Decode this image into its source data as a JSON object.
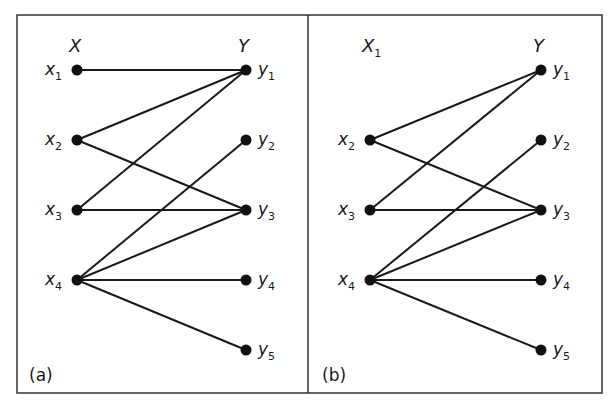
{
  "figure": {
    "frame": {
      "x": 17,
      "y": 15,
      "width": 585,
      "height": 378,
      "divider_x": 308
    },
    "colors": {
      "stroke": "#1a1a1a",
      "node": "#111111",
      "background": "#ffffff"
    },
    "panels": [
      {
        "id": "a",
        "caption": "(a)",
        "set_labels": {
          "x": "X",
          "x_sub": "",
          "y": "Y"
        },
        "x_col": 77,
        "y_col": 246,
        "x_nodes": [
          {
            "id": "x1",
            "label": "x",
            "sub": "1",
            "row": 0
          },
          {
            "id": "x2",
            "label": "x",
            "sub": "2",
            "row": 1
          },
          {
            "id": "x3",
            "label": "x",
            "sub": "3",
            "row": 2
          },
          {
            "id": "x4",
            "label": "x",
            "sub": "4",
            "row": 3
          }
        ],
        "y_nodes": [
          {
            "id": "y1",
            "label": "y",
            "sub": "1",
            "row": 0
          },
          {
            "id": "y2",
            "label": "y",
            "sub": "2",
            "row": 1
          },
          {
            "id": "y3",
            "label": "y",
            "sub": "3",
            "row": 2
          },
          {
            "id": "y4",
            "label": "y",
            "sub": "4",
            "row": 3
          },
          {
            "id": "y5",
            "label": "y",
            "sub": "5",
            "row": 4
          }
        ],
        "edges": [
          [
            "x1",
            "y1"
          ],
          [
            "x2",
            "y1"
          ],
          [
            "x2",
            "y3"
          ],
          [
            "x3",
            "y1"
          ],
          [
            "x3",
            "y3"
          ],
          [
            "x4",
            "y2"
          ],
          [
            "x4",
            "y3"
          ],
          [
            "x4",
            "y4"
          ],
          [
            "x4",
            "y5"
          ]
        ]
      },
      {
        "id": "b",
        "caption": "(b)",
        "set_labels": {
          "x": "X",
          "x_sub": "1",
          "y": "Y"
        },
        "x_col": 370,
        "y_col": 541,
        "x_nodes": [
          {
            "id": "x2",
            "label": "x",
            "sub": "2",
            "row": 1
          },
          {
            "id": "x3",
            "label": "x",
            "sub": "3",
            "row": 2
          },
          {
            "id": "x4",
            "label": "x",
            "sub": "4",
            "row": 3
          }
        ],
        "y_nodes": [
          {
            "id": "y1",
            "label": "y",
            "sub": "1",
            "row": 0
          },
          {
            "id": "y2",
            "label": "y",
            "sub": "2",
            "row": 1
          },
          {
            "id": "y3",
            "label": "y",
            "sub": "3",
            "row": 2
          },
          {
            "id": "y4",
            "label": "y",
            "sub": "4",
            "row": 3
          },
          {
            "id": "y5",
            "label": "y",
            "sub": "5",
            "row": 4
          }
        ],
        "edges": [
          [
            "x2",
            "y1"
          ],
          [
            "x2",
            "y3"
          ],
          [
            "x3",
            "y1"
          ],
          [
            "x3",
            "y3"
          ],
          [
            "x4",
            "y2"
          ],
          [
            "x4",
            "y3"
          ],
          [
            "x4",
            "y4"
          ],
          [
            "x4",
            "y5"
          ]
        ]
      }
    ],
    "rows_y": [
      70,
      140,
      210,
      280,
      350
    ],
    "set_label_y": 52,
    "caption_y": 381
  }
}
